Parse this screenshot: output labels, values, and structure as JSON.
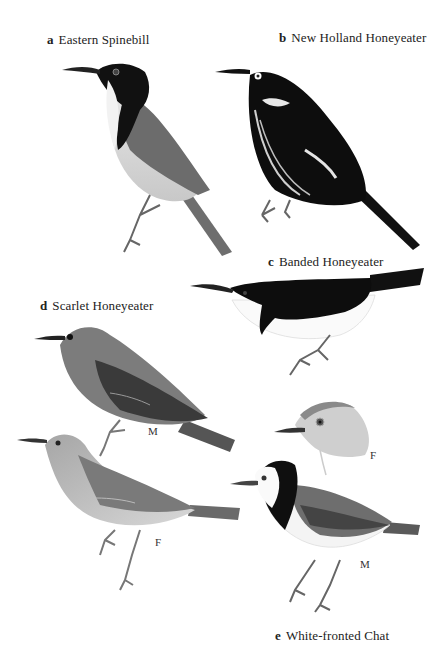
{
  "plate": {
    "species": [
      {
        "letter": "a",
        "name": "Eastern Spinebill"
      },
      {
        "letter": "b",
        "name": "New Holland Honeyeater"
      },
      {
        "letter": "c",
        "name": "Banded Honeyeater"
      },
      {
        "letter": "d",
        "name": "Scarlet Honeyeater"
      },
      {
        "letter": "e",
        "name": "White-fronted Chat"
      }
    ],
    "sex_labels": {
      "scarlet_male": "M",
      "scarlet_female": "F",
      "chat_female": "F",
      "chat_male": "M"
    }
  }
}
